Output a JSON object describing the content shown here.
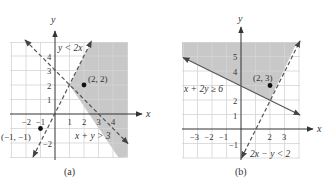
{
  "panels": [
    {
      "caption": "(a)",
      "axis_x_label": "x",
      "axis_y_label": "y",
      "x_ticks": [
        "−2",
        "−1",
        "1",
        "2",
        "3",
        "4"
      ],
      "y_ticks": [
        "4",
        "3",
        "2",
        "1",
        "−2"
      ],
      "inequality_1": "y < 2x",
      "inequality_2": "x + y > 3",
      "point_1_label": "(2, 2)",
      "point_2_label": "(−1, −1)"
    },
    {
      "caption": "(b)",
      "axis_x_label": "x",
      "axis_y_label": "y",
      "x_ticks": [
        "−3",
        "−2",
        "−1",
        "2",
        "3"
      ],
      "y_ticks": [
        "5",
        "4",
        "2",
        "1",
        "−1"
      ],
      "inequality_1": "x + 2y ≥ 6",
      "inequality_2": "2x − y < 2",
      "point_1_label": "(2, 3)"
    }
  ],
  "colors": {
    "shade": "#c8c8c8",
    "grid": "#d4d4d4",
    "axis": "#333333",
    "line": "#555555",
    "point": "#111111"
  }
}
